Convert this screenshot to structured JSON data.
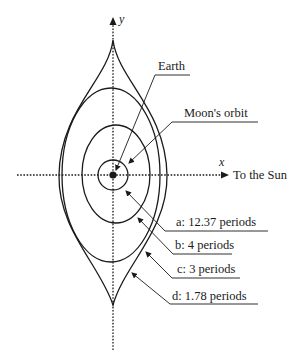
{
  "diagram": {
    "axes": {
      "x_label": "x",
      "y_label": "y",
      "x_direction_label": "To the Sun"
    },
    "labels": {
      "earth": "Earth",
      "moon_orbit": "Moon's orbit"
    },
    "orbits": [
      {
        "id": "a",
        "label": "a: 12.37 periods"
      },
      {
        "id": "b",
        "label": "b: 4 periods"
      },
      {
        "id": "c",
        "label": "c: 3 periods"
      },
      {
        "id": "d",
        "label": "d: 1.78 periods"
      }
    ],
    "colors": {
      "ink": "#1a1a1a",
      "background": "#ffffff"
    }
  }
}
